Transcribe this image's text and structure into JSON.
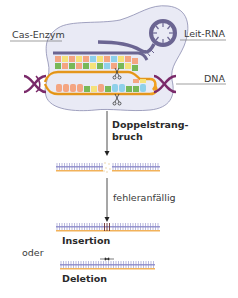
{
  "labels": {
    "cas_enzyme": "Cas-Enzym",
    "guide_rna": "Leit-RNA",
    "dna": "DNA",
    "double_strand_break_line1": "Doppelstrang-",
    "double_strand_break_line2": "bruch",
    "error_prone": "fehleranfällig",
    "insertion": "Insertion",
    "or": "oder",
    "deletion": "Deletion"
  },
  "colors": {
    "enzyme_fill": "#e9eaf5",
    "enzyme_stroke": "#7b7fa8",
    "rna": "#6b6592",
    "dna_backbone": "#f0a020",
    "helix": "#7a2a6a",
    "strand_blue": "#8a8ac8",
    "strand_orange": "#f2b25a",
    "base_orange": "#f4a582",
    "base_green": "#78b858",
    "base_yellow": "#f5e27a",
    "base_blue": "#8fd0ea"
  }
}
